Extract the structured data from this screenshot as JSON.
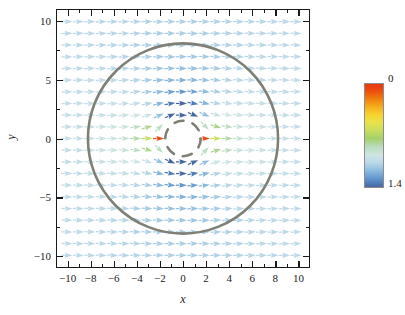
{
  "figure": {
    "kind": "vector-field-plot",
    "background": "#ffffff"
  },
  "axes": {
    "x": {
      "label": "x",
      "range": [
        -11,
        11
      ],
      "major_ticks": [
        -10,
        -8,
        -6,
        -4,
        -2,
        0,
        2,
        4,
        6,
        8,
        10
      ],
      "major_tick_labels": [
        "-10",
        "-8",
        "-6",
        "-4",
        "-2",
        "0",
        "2",
        "4",
        "6",
        "8",
        "10"
      ],
      "minor_ticks": [
        -11,
        -9,
        -7,
        -5,
        -3,
        -1,
        1,
        3,
        5,
        7,
        9,
        11
      ]
    },
    "y": {
      "label": "y",
      "range": [
        -11,
        11
      ],
      "major_ticks": [
        10,
        5,
        0,
        -5,
        -10
      ],
      "major_tick_labels": [
        "10",
        "5",
        "0",
        "-5",
        "-10"
      ],
      "minor_ticks": [
        7.5,
        2.5,
        -2.5,
        -7.5
      ]
    },
    "frame_color": "#1a1a1a",
    "grid": false
  },
  "colorbar": {
    "max_label": "0",
    "min_label": "1.4",
    "vmin": 0,
    "vmax": 1.4,
    "orientation": "vertical",
    "reversed": true,
    "stops": [
      "#e8380d",
      "#ea4a0c",
      "#ef7c0d",
      "#f5ad1d",
      "#f6d32e",
      "#e9e24a",
      "#c9dd5e",
      "#a5d06a",
      "#b9dcbe",
      "#cfe5e4",
      "#bcd9e8",
      "#93c0e0",
      "#6a9fd2",
      "#4f7db8",
      "#46689f"
    ]
  },
  "overlays": {
    "outer_circle": {
      "center": [
        0,
        0
      ],
      "radius": 8.3,
      "style": "solid",
      "color": "#7f7f76",
      "line_width": 2.6
    },
    "inner_circle": {
      "center": [
        0,
        0
      ],
      "radius": 1.55,
      "style": "dashed",
      "color": "#7f7f76",
      "line_width": 2.6,
      "dash_count": 6
    },
    "inner_disk_blank": {
      "center": [
        0,
        0
      ],
      "radius": 1.35,
      "fill": "#ffffff"
    }
  },
  "chart_data": {
    "type": "scatter",
    "title": "",
    "xlabel": "x",
    "ylabel": "y",
    "xlim": [
      -11,
      11
    ],
    "ylim": [
      -11,
      11
    ],
    "grid": false,
    "legend": "none",
    "colorbar": {
      "vmin": 0,
      "vmax": 1.4,
      "tick_labels": [
        "0",
        "1.4"
      ]
    },
    "field": {
      "description": "Uniform rightward flow past a circular obstacle; arrows colored by field magnitude (reversed colormap: 0=red, 1.4=blue)",
      "grid_nx": 21,
      "grid_ny": 21,
      "x_start": -10,
      "x_step": 1,
      "y_start": 10,
      "y_step": -1,
      "base_flow_direction_deg": 0,
      "far_field_value": 1.0,
      "arrow_glyph": "cone",
      "blank_radius": 1.35
    }
  }
}
